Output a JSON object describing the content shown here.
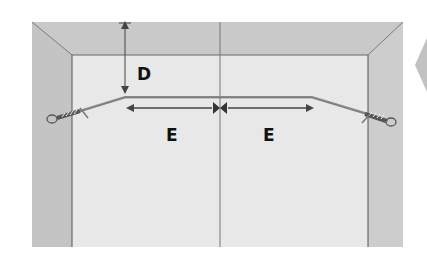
{
  "diagram": {
    "type": "wire-installation-measurement",
    "labels": {
      "drop_distance": "D",
      "left_span": "E",
      "right_span": "E"
    },
    "colors": {
      "ceiling": "#c9c9c9",
      "side_wall_left": "#c4c4c4",
      "side_wall_right": "#cdcdcd",
      "back_wall": "#e6e6e6",
      "lines": "#555555",
      "wire": "#777777",
      "next_arrow": "#bdbdbd"
    }
  }
}
